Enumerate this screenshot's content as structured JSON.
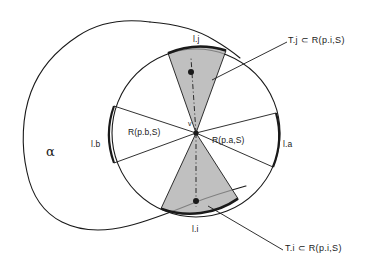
{
  "figure": {
    "background_color": "#ffffff",
    "ink_color": "#1a1a1a",
    "wedge_fill_color": "#a8a8a8"
  },
  "labels": {
    "alpha": "α",
    "vertex": "v",
    "top_arc": "l.j",
    "bottom_arc": "l.i",
    "right_arc": "l.a",
    "left_arc": "l.b",
    "region_right": "R(p.a,S)",
    "region_left": "R(p.b,S)",
    "caption_top": "T.j  ⊂  R(p.i,S)",
    "caption_bottom": "T.i  ⊂  R(p.i,S)"
  },
  "geometry": {
    "circle_center": [
      196,
      133
    ],
    "circle_radius": 84,
    "vertex_point": [
      196,
      133
    ],
    "top_site_point": [
      191,
      72
    ],
    "bottom_site_point": [
      196,
      201
    ]
  }
}
